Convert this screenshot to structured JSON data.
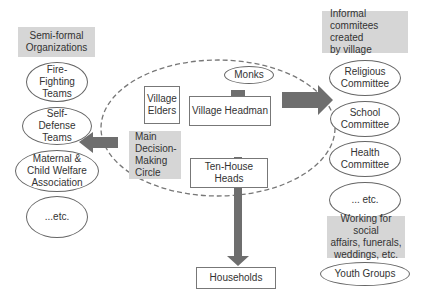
{
  "left": {
    "header": "Semi-formal\nOrganizations",
    "items": [
      "Fire-\nFighting\nTeams",
      "Self-\nDefense\nTeams",
      "Maternal &\nChild Welfare\nAssociation",
      "...etc."
    ]
  },
  "center": {
    "monks": "Monks",
    "village_elders": "Village\nElders",
    "village_headman": "Village Headman",
    "main_circle_label": "Main\nDecision-\nMaking\nCircle",
    "ten_house_heads": "Ten-House\nHeads",
    "households": "Households"
  },
  "right": {
    "header": "Informal\ncommitees created\nby village",
    "items": [
      "Religious\nCommittee",
      "School\nCommittee",
      "Health\nCommittee",
      "... etc."
    ],
    "social_header": "Working for social\naffairs, funerals,\nweddings, etc.",
    "youth": "Youth Groups"
  },
  "colors": {
    "arrow": "#6e6e6e",
    "gray_box": "#d6d6d6",
    "dashed": "#777777"
  }
}
